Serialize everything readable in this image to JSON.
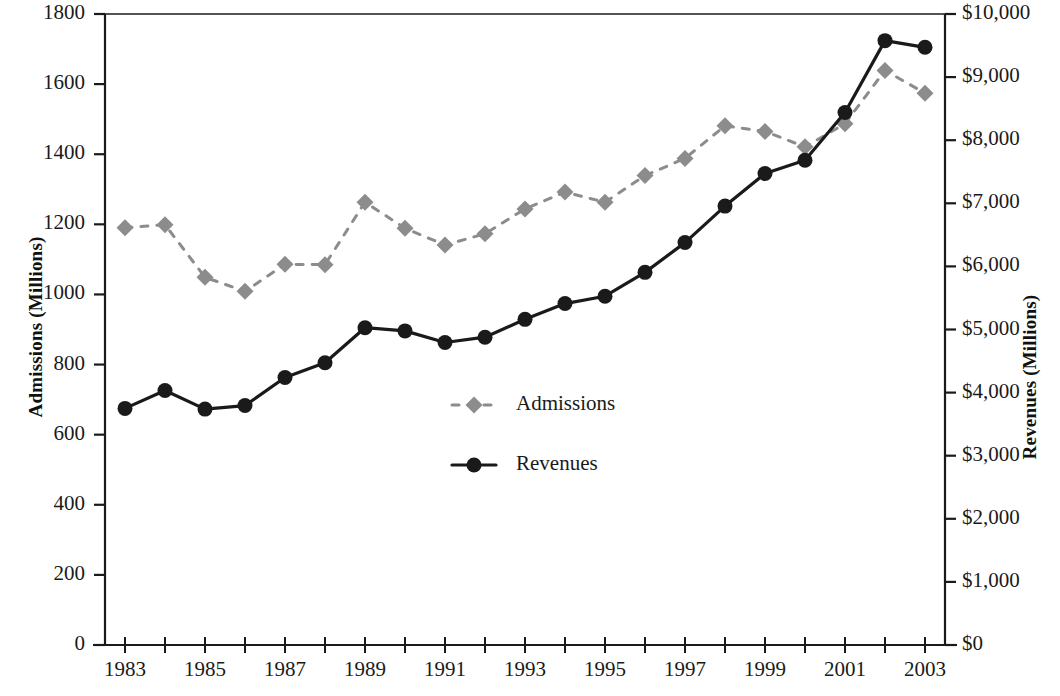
{
  "chart_data": {
    "type": "line",
    "title": "",
    "xlabel": "",
    "ylabel": "Admissions (Millions)",
    "y2label": "Revenues (Millions)",
    "grid": false,
    "legend_position": "center",
    "x": [
      1983,
      1984,
      1985,
      1986,
      1987,
      1988,
      1989,
      1990,
      1991,
      1992,
      1993,
      1994,
      1995,
      1996,
      1997,
      1998,
      1999,
      2000,
      2001,
      2002,
      2003
    ],
    "xlim": [
      1982.5,
      2003.5
    ],
    "xticks": [
      1983,
      1984,
      1985,
      1986,
      1987,
      1988,
      1989,
      1990,
      1991,
      1992,
      1993,
      1994,
      1995,
      1996,
      1997,
      1998,
      1999,
      2000,
      2001,
      2002,
      2003
    ],
    "xtick_labels": [
      "1983",
      "",
      "1985",
      "",
      "1987",
      "",
      "1989",
      "",
      "1991",
      "",
      "1993",
      "",
      "1995",
      "",
      "1997",
      "",
      "1999",
      "",
      "2001",
      "",
      "2003"
    ],
    "ylim": [
      0,
      1800
    ],
    "yticks": [
      0,
      200,
      400,
      600,
      800,
      1000,
      1200,
      1400,
      1600,
      1800
    ],
    "ytick_labels": [
      "0",
      "200",
      "400",
      "600",
      "800",
      "1000",
      "1200",
      "1400",
      "1600",
      "1800"
    ],
    "y2lim": [
      0,
      10000
    ],
    "y2ticks": [
      0,
      1000,
      2000,
      3000,
      4000,
      5000,
      6000,
      7000,
      8000,
      9000,
      10000
    ],
    "y2tick_labels": [
      "$0",
      "$1,000",
      "$2,000",
      "$3,000",
      "$4,000",
      "$5,000",
      "$6,000",
      "$7,000",
      "$8,000",
      "$9,000",
      "$10,000"
    ],
    "series": [
      {
        "name": "Admissions",
        "axis": "left",
        "unit": "Millions",
        "color": "#8c8c8c",
        "line_style": "dashed",
        "marker": "diamond",
        "values": [
          1190,
          1199,
          1049,
          1009,
          1086,
          1085,
          1263,
          1189,
          1141,
          1173,
          1244,
          1292,
          1263,
          1339,
          1388,
          1481,
          1465,
          1421,
          1487,
          1639,
          1574
        ]
      },
      {
        "name": "Revenues",
        "axis": "right",
        "unit": "Millions of dollars",
        "color": "#1a1a1a",
        "line_style": "solid",
        "marker": "circle",
        "values_left_scale": [
          675,
          726,
          673,
          683,
          763,
          805,
          905,
          896,
          863,
          878,
          929,
          974,
          995,
          1063,
          1148,
          1252,
          1345,
          1383,
          1519,
          1724,
          1705
        ],
        "values": [
          3750,
          4033,
          3738,
          3794,
          4239,
          4472,
          5028,
          4978,
          4794,
          4878,
          5161,
          5411,
          5528,
          5906,
          6378,
          6956,
          7472,
          7683,
          8439,
          9578,
          9472
        ]
      }
    ]
  },
  "legend": {
    "items": [
      {
        "label": "Admissions",
        "marker": "diamond",
        "style": "dashed",
        "color": "#8c8c8c"
      },
      {
        "label": "Revenues",
        "marker": "circle",
        "style": "solid",
        "color": "#1a1a1a"
      }
    ]
  }
}
